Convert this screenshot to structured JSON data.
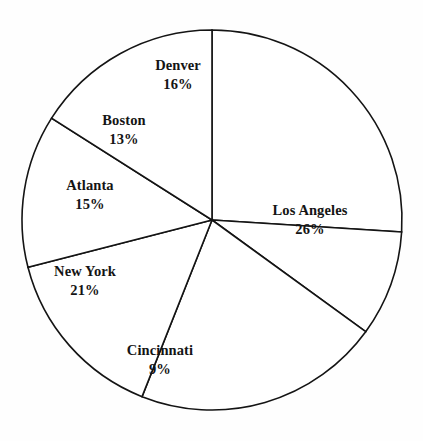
{
  "chart_data": {
    "type": "pie",
    "title": "",
    "subtitle": "",
    "xlabel": "",
    "ylabel": "",
    "legend_position": "none",
    "grid": false,
    "label_format": "name above percent",
    "start_angle_deg": 0,
    "direction": "clockwise",
    "units": "percent",
    "categories": [
      "Los Angeles",
      "Cincinnati",
      "New York",
      "Atlanta",
      "Boston",
      "Denver"
    ],
    "values": [
      26,
      9,
      21,
      15,
      13,
      16
    ],
    "total": 100,
    "slices": [
      {
        "name": "Los Angeles",
        "percent": 26,
        "value_label": "26%",
        "start_deg": 0,
        "end_deg": 93.6,
        "label_x": 310,
        "label_y": 220
      },
      {
        "name": "Cincinnati",
        "percent": 9,
        "value_label": "9%",
        "start_deg": 93.6,
        "end_deg": 126.0,
        "label_x": 160,
        "label_y": 360
      },
      {
        "name": "New York",
        "percent": 21,
        "value_label": "21%",
        "start_deg": 126.0,
        "end_deg": 201.6,
        "label_x": 85,
        "label_y": 281
      },
      {
        "name": "Atlanta",
        "percent": 15,
        "value_label": "15%",
        "start_deg": 201.6,
        "end_deg": 255.6,
        "label_x": 90,
        "label_y": 195
      },
      {
        "name": "Boston",
        "percent": 13,
        "value_label": "13%",
        "start_deg": 255.6,
        "end_deg": 302.4,
        "label_x": 124,
        "label_y": 130
      },
      {
        "name": "Denver",
        "percent": 16,
        "value_label": "16%",
        "start_deg": 302.4,
        "end_deg": 360.0,
        "label_x": 178,
        "label_y": 75
      }
    ],
    "colors": {
      "slice_fill": "#ffffff",
      "slice_stroke": "#141414",
      "label_text": "#141414",
      "background": "#fefefe"
    },
    "geometry": {
      "center_x": 212,
      "center_y": 220,
      "radius": 190
    }
  }
}
